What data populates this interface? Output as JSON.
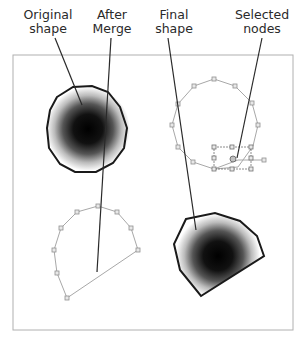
{
  "labels": {
    "original_shape": "Original\nshape",
    "after_merge": "After\nMerge",
    "final_shape": "Final\nshape",
    "selected_nodes": "Selected\nnodes"
  },
  "colors": {
    "frame": "#b0b0b0",
    "outline": "#1a1a1a",
    "path_gray": "#a8a8a8",
    "node_fill": "#e8e8e8",
    "leader": "#2a2a2a"
  }
}
